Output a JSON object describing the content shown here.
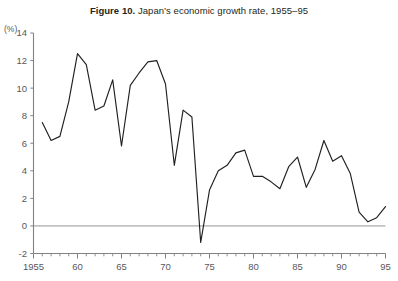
{
  "figure": {
    "label": "Figure 10.",
    "caption": "Japan’s economic growth rate, 1955–95",
    "unit_label": "(%)"
  },
  "chart_data": {
    "type": "line",
    "title": "Figure 10. Japan’s economic growth rate, 1955–95",
    "xlabel": "",
    "ylabel": "(%)",
    "xlim": [
      1955,
      1995
    ],
    "ylim": [
      -2,
      14
    ],
    "y_ticks": [
      -2,
      0,
      2,
      4,
      6,
      8,
      10,
      12,
      14
    ],
    "y_tick_labels": [
      "-2",
      "0",
      "2",
      "4",
      "6",
      "8",
      "10",
      "12",
      "14"
    ],
    "x_ticks": [
      1955,
      1960,
      1965,
      1970,
      1975,
      1980,
      1985,
      1990,
      1995
    ],
    "x_tick_labels": [
      "1955",
      "60",
      "65",
      "70",
      "75",
      "80",
      "85",
      "90",
      "95"
    ],
    "x_minor_tick_step": 1,
    "grid": false,
    "legend": null,
    "zero_line": 0,
    "line_color": "#231f20",
    "axis_color": "#808285",
    "series": [
      {
        "name": "Japan real GDP growth rate",
        "x": [
          1956,
          1957,
          1958,
          1959,
          1960,
          1961,
          1962,
          1963,
          1964,
          1965,
          1966,
          1967,
          1968,
          1969,
          1970,
          1971,
          1972,
          1973,
          1974,
          1975,
          1976,
          1977,
          1978,
          1979,
          1980,
          1981,
          1982,
          1983,
          1984,
          1985,
          1986,
          1987,
          1988,
          1989,
          1990,
          1991,
          1992,
          1993,
          1994,
          1995
        ],
        "values": [
          7.5,
          6.2,
          6.5,
          9.0,
          12.5,
          11.7,
          8.4,
          8.7,
          10.6,
          5.8,
          10.2,
          11.1,
          11.9,
          12.0,
          10.3,
          4.4,
          8.4,
          7.9,
          -1.2,
          2.6,
          4.0,
          4.4,
          5.3,
          5.5,
          3.6,
          3.6,
          3.2,
          2.7,
          4.3,
          5.0,
          2.8,
          4.1,
          6.2,
          4.7,
          5.1,
          3.8,
          1.0,
          0.3,
          0.6,
          1.4
        ]
      }
    ]
  }
}
